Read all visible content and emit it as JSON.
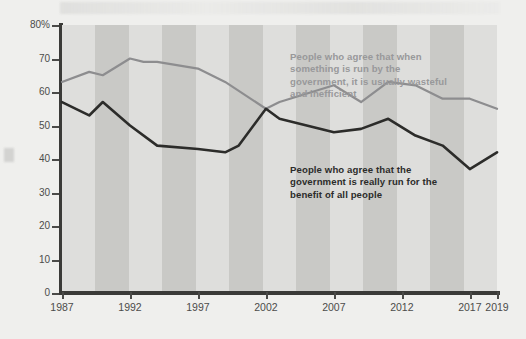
{
  "chart_data": {
    "type": "line",
    "title": "",
    "subtitle": "",
    "xlabel": "",
    "ylabel": "",
    "xlim": [
      1987,
      2019
    ],
    "ylim": [
      0,
      80
    ],
    "grid": false,
    "legend_position": "inline-annotations",
    "yticks": [
      0,
      10,
      20,
      30,
      40,
      50,
      60,
      70,
      80
    ],
    "ytick_labels": [
      "0",
      "10",
      "20",
      "30",
      "40",
      "50",
      "60",
      "70",
      "80%"
    ],
    "xticks": [
      1987,
      1992,
      1997,
      2002,
      2007,
      2012,
      2017,
      2019
    ],
    "xtick_labels": [
      "1987",
      "1992",
      "1997",
      "2002",
      "2007",
      "2012",
      "2017",
      "2019"
    ],
    "series": [
      {
        "name": "People who agree that when something is run by the government, it is usually wasteful and inefficient",
        "color": "#8d8d8f",
        "x": [
          1987,
          1989,
          1990,
          1992,
          1993,
          1994,
          1997,
          1999,
          2002,
          2003,
          2007,
          2009,
          2011,
          2013,
          2015,
          2017,
          2019
        ],
        "values": [
          63,
          66,
          65,
          70,
          69,
          69,
          67,
          63,
          55,
          57,
          62,
          57,
          63,
          62,
          58,
          58,
          55
        ]
      },
      {
        "name": "People who agree that the government is really run for the benefit of all people",
        "color": "#2c2c2a",
        "x": [
          1987,
          1989,
          1990,
          1992,
          1994,
          1997,
          1999,
          2000,
          2002,
          2003,
          2007,
          2009,
          2011,
          2013,
          2015,
          2017,
          2019
        ],
        "values": [
          57,
          53,
          57,
          50,
          44,
          43,
          42,
          44,
          55,
          52,
          48,
          49,
          52,
          47,
          44,
          37,
          42
        ]
      }
    ],
    "annotations": [
      {
        "id": "annotation-gray",
        "text": "People who agree that when something is run by the government, it is usually wasteful and inefficient",
        "color": "#98989a"
      },
      {
        "id": "annotation-black",
        "text": "People who agree that the government is really run for the benefit of all people",
        "color": "#2c2c2a"
      }
    ],
    "background_bands": {
      "light": "#dededc",
      "dark": "#c9c9c6",
      "count": 13
    },
    "axis_color": "#3a3a38",
    "page_background": "#efefed"
  }
}
